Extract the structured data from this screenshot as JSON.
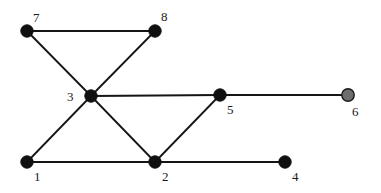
{
  "figure": {
    "kind": "undirected-graph-drawing",
    "background_color": "#ffffff",
    "width": 381,
    "height": 193
  },
  "style": {
    "edge_color": "#151515",
    "edge_width": 1.8,
    "node_radius": 6.2,
    "node_default_fill": "#101010",
    "node_default_stroke": "#101010",
    "node_highlight_fill": "#6e6e6e",
    "node_highlight_stroke": "#1a1a1a",
    "label_color": "#1a1a1a",
    "label_font_size": "13px"
  },
  "graph_data": {
    "type": "graph",
    "directed": false,
    "node_count": 8,
    "edge_count": 10,
    "nodes": [
      {
        "id": "1",
        "label": "1",
        "x": 27,
        "y": 162,
        "fill": "#101010",
        "stroke": "#101010",
        "highlighted": false,
        "label_x": 34,
        "label_y": 170,
        "degree": 2
      },
      {
        "id": "2",
        "label": "2",
        "x": 155,
        "y": 162,
        "fill": "#101010",
        "stroke": "#101010",
        "highlighted": false,
        "label_x": 162,
        "label_y": 170,
        "degree": 4
      },
      {
        "id": "3",
        "label": "3",
        "x": 91,
        "y": 96,
        "fill": "#101010",
        "stroke": "#101010",
        "highlighted": false,
        "label_x": 67,
        "label_y": 90,
        "degree": 5
      },
      {
        "id": "4",
        "label": "4",
        "x": 285,
        "y": 162,
        "fill": "#101010",
        "stroke": "#101010",
        "highlighted": false,
        "label_x": 292,
        "label_y": 170,
        "degree": 1
      },
      {
        "id": "5",
        "label": "5",
        "x": 220,
        "y": 95,
        "fill": "#101010",
        "stroke": "#101010",
        "highlighted": false,
        "label_x": 227,
        "label_y": 103,
        "degree": 3
      },
      {
        "id": "6",
        "label": "6",
        "x": 348,
        "y": 95,
        "fill": "#6e6e6e",
        "stroke": "#1a1a1a",
        "highlighted": true,
        "label_x": 352,
        "label_y": 105,
        "degree": 1
      },
      {
        "id": "7",
        "label": "7",
        "x": 27,
        "y": 31,
        "fill": "#101010",
        "stroke": "#101010",
        "highlighted": false,
        "label_x": 33,
        "label_y": 11,
        "degree": 2
      },
      {
        "id": "8",
        "label": "8",
        "x": 155,
        "y": 31,
        "fill": "#101010",
        "stroke": "#101010",
        "highlighted": false,
        "label_x": 161,
        "label_y": 10,
        "degree": 2
      }
    ],
    "edges": [
      {
        "source": "7",
        "target": "8"
      },
      {
        "source": "7",
        "target": "3"
      },
      {
        "source": "8",
        "target": "3"
      },
      {
        "source": "3",
        "target": "1"
      },
      {
        "source": "3",
        "target": "2"
      },
      {
        "source": "3",
        "target": "5"
      },
      {
        "source": "1",
        "target": "2"
      },
      {
        "source": "2",
        "target": "5"
      },
      {
        "source": "2",
        "target": "4"
      },
      {
        "source": "5",
        "target": "6"
      }
    ]
  }
}
